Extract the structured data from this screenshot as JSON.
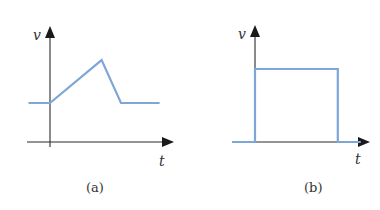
{
  "colors": {
    "signal": "#7fa6d8",
    "axis": "#2a2a2a",
    "text": "#333333"
  },
  "panels": [
    {
      "id": "a",
      "caption": "(a)",
      "y_axis_label": "v",
      "x_axis_label": "t",
      "signal_shape": "ramp-up-then-down",
      "signal_description": "Constant level before t=0, linear ramp up to a peak, steeper linear drop back to the original level, then constant",
      "points": [
        {
          "t": -1.0,
          "v": 1.0
        },
        {
          "t": 0.0,
          "v": 1.0
        },
        {
          "t": 2.4,
          "v": 2.1
        },
        {
          "t": 3.3,
          "v": 1.0
        },
        {
          "t": 5.1,
          "v": 1.0
        }
      ]
    },
    {
      "id": "b",
      "caption": "(b)",
      "y_axis_label": "v",
      "x_axis_label": "t",
      "signal_shape": "rectangular-pulse",
      "signal_description": "Zero before t=0, steps up to a constant level, stays constant, steps back down to zero",
      "points": [
        {
          "t": -1.0,
          "v": 0.0
        },
        {
          "t": 0.0,
          "v": 0.0
        },
        {
          "t": 0.0,
          "v": 1.0
        },
        {
          "t": 3.6,
          "v": 1.0
        },
        {
          "t": 3.6,
          "v": 0.0
        },
        {
          "t": 4.6,
          "v": 0.0
        }
      ]
    }
  ]
}
